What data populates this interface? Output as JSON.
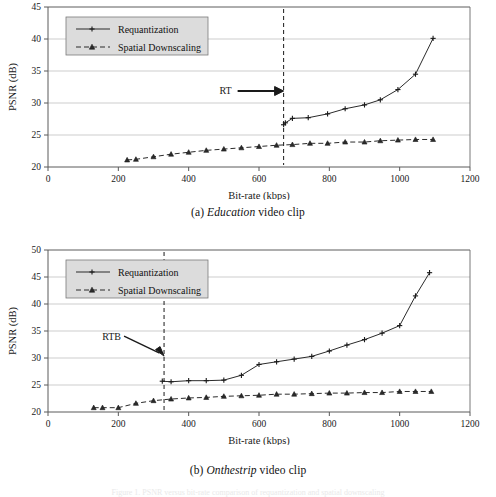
{
  "figure": {
    "panels": [
      {
        "id": "a",
        "caption_prefix": "(a)",
        "caption_emphasis": "Education",
        "caption_suffix": "video clip"
      },
      {
        "id": "b",
        "caption_prefix": "(b)",
        "caption_emphasis": "Onthestrip",
        "caption_suffix": "video clip"
      }
    ],
    "footer_partial": "Figure 1.  PSNR versus bit-rate comparison of requantization and spatial downscaling"
  },
  "chart_data": [
    {
      "id": "chart-a",
      "type": "line",
      "title": "",
      "xlabel": "Bit-rate (kbps)",
      "ylabel": "PSNR (dB)",
      "xlim": [
        0,
        1200
      ],
      "ylim": [
        20,
        45
      ],
      "xticks": [
        0,
        200,
        400,
        600,
        800,
        1000,
        1200
      ],
      "yticks": [
        20,
        25,
        30,
        35,
        40,
        45
      ],
      "grid": "horizontal",
      "legend_position": "top-left",
      "annotations": [
        {
          "label": "RT",
          "x": 670,
          "style": "vertical-dashed-line-with-arrow",
          "arrow": "horizontal-right"
        }
      ],
      "series": [
        {
          "name": "Requantization",
          "marker": "plus",
          "linestyle": "solid",
          "x": [
            670,
            675,
            695,
            740,
            795,
            845,
            900,
            945,
            995,
            1045,
            1095
          ],
          "y": [
            26.6,
            26.9,
            27.6,
            27.7,
            28.3,
            29.1,
            29.7,
            30.5,
            32.1,
            34.5,
            40.1
          ]
        },
        {
          "name": "Spatial Downscaling",
          "marker": "triangle",
          "linestyle": "dashed",
          "x": [
            225,
            250,
            300,
            350,
            400,
            450,
            500,
            550,
            600,
            650,
            695,
            745,
            795,
            845,
            900,
            945,
            995,
            1045,
            1095
          ],
          "y": [
            21.1,
            21.2,
            21.6,
            22.0,
            22.3,
            22.6,
            22.8,
            23.0,
            23.2,
            23.4,
            23.5,
            23.7,
            23.7,
            23.9,
            23.9,
            24.1,
            24.2,
            24.3,
            24.3
          ]
        }
      ]
    },
    {
      "id": "chart-b",
      "type": "line",
      "title": "",
      "xlabel": "Bit-rate (kbps)",
      "ylabel": "PSNR (dB)",
      "xlim": [
        0,
        1200
      ],
      "ylim": [
        20,
        50
      ],
      "xticks": [
        0,
        200,
        400,
        600,
        800,
        1000,
        1200
      ],
      "yticks": [
        20,
        25,
        30,
        35,
        40,
        45,
        50
      ],
      "grid": "horizontal",
      "legend_position": "top-left",
      "annotations": [
        {
          "label": "RTB",
          "x": 330,
          "style": "vertical-dashed-line-with-arrow",
          "arrow": "diagonal-down-right"
        }
      ],
      "series": [
        {
          "name": "Requantization",
          "marker": "plus",
          "linestyle": "solid",
          "x": [
            325,
            350,
            400,
            450,
            500,
            550,
            600,
            650,
            700,
            750,
            800,
            850,
            900,
            950,
            1000,
            1045,
            1085
          ],
          "y": [
            25.7,
            25.6,
            25.8,
            25.8,
            25.9,
            26.8,
            28.8,
            29.3,
            29.8,
            30.3,
            31.3,
            32.4,
            33.4,
            34.6,
            36.0,
            41.5,
            45.8
          ]
        },
        {
          "name": "Spatial Downscaling",
          "marker": "triangle",
          "linestyle": "dashed",
          "x": [
            130,
            155,
            200,
            250,
            300,
            350,
            400,
            450,
            500,
            550,
            600,
            650,
            700,
            750,
            800,
            850,
            900,
            950,
            1000,
            1045,
            1090
          ],
          "y": [
            20.8,
            20.8,
            20.8,
            21.6,
            22.1,
            22.4,
            22.6,
            22.7,
            22.9,
            23.0,
            23.1,
            23.3,
            23.3,
            23.4,
            23.5,
            23.5,
            23.6,
            23.6,
            23.8,
            23.8,
            23.8
          ]
        }
      ]
    }
  ]
}
